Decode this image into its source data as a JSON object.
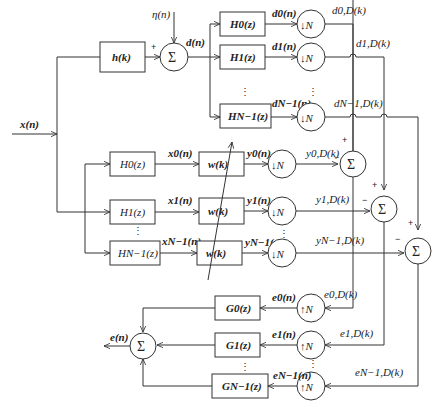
{
  "input": {
    "label": "x(n)"
  },
  "noise": {
    "label": "η(n)"
  },
  "unknown_system": {
    "label": "h(k)"
  },
  "desired": {
    "label": "d(n)"
  },
  "sum_symbol": "Σ",
  "down_symbol": "↓N",
  "up_symbol": "↑N",
  "plus": "+",
  "minus": "−",
  "vdots": "⋮",
  "analysis_desired": [
    {
      "filter": "H0(z)",
      "out": "d0(n)",
      "dec": "d0,D(k)"
    },
    {
      "filter": "H1(z)",
      "out": "d1(n)",
      "dec": "d1,D(k)"
    },
    {
      "filter": "HN−1(z)",
      "out": "dN−1(n)",
      "dec": "dN−1,D(k)"
    }
  ],
  "analysis_input": [
    {
      "filter": "H0(z)",
      "out": "x0(n)"
    },
    {
      "filter": "H1(z)",
      "out": "x1(n)"
    },
    {
      "filter": "HN−1(z)",
      "out": "xN−1(n)"
    }
  ],
  "adaptive": [
    {
      "filter": "w(k)",
      "out": "y0(n)",
      "dec": "y0,D(k)"
    },
    {
      "filter": "w(k)",
      "out": "y1(n)",
      "dec": "y1,D(k)"
    },
    {
      "filter": "w(k)",
      "out": "yN−1(n)",
      "dec": "yN−1,D(k)"
    }
  ],
  "synthesis": [
    {
      "filter": "G0(z)",
      "in": "e0(n)",
      "err": "e0,D(k)"
    },
    {
      "filter": "G1(z)",
      "in": "e1(n)",
      "err": "e1,D(k)"
    },
    {
      "filter": "GN−1(z)",
      "in": "eN−1(n)",
      "err": "eN−1,D(k)"
    }
  ],
  "output": {
    "label": "e(n)"
  }
}
